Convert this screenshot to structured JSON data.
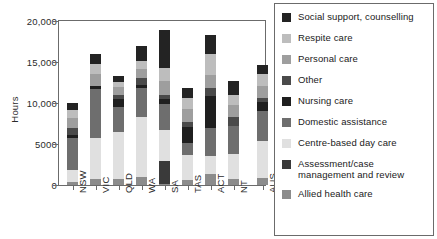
{
  "chart_data": {
    "type": "bar",
    "subtype": "stacked-bar",
    "title": "",
    "xlabel": "",
    "ylabel": "Hours",
    "ylim": [
      0,
      20000
    ],
    "yticks": [
      0,
      5000,
      10000,
      15000,
      20000
    ],
    "ytick_labels": [
      "0",
      "5000",
      "10,000",
      "15,000",
      "20,000"
    ],
    "grid": false,
    "legend_position": "right",
    "categories": [
      "NSW",
      "VIC",
      "QLD",
      "WA",
      "SA",
      "TAS",
      "ACT",
      "NT",
      "AUS"
    ],
    "series": [
      {
        "name": "Allied health care",
        "color": "#8c8c8c",
        "values": [
          420,
          740,
          700,
          950,
          180,
          640,
          1300,
          700,
          900
        ]
      },
      {
        "name": "Assessment/case management and review",
        "color": "#3a3a3a",
        "values": [
          0,
          0,
          0,
          0,
          2700,
          0,
          0,
          0,
          0
        ]
      },
      {
        "name": "Centre-based day care",
        "color": "#e0e0e0",
        "values": [
          1380,
          5050,
          5770,
          7320,
          3800,
          3060,
          2200,
          3050,
          4500
        ]
      },
      {
        "name": "Domestic assistance",
        "color": "#6e6e6e",
        "values": [
          3900,
          5900,
          3100,
          3550,
          3200,
          1450,
          3500,
          3450,
          3600
        ]
      },
      {
        "name": "Nursing care",
        "color": "#1f1f1f",
        "values": [
          450,
          380,
          870,
          440,
          600,
          1900,
          3900,
          0,
          1150
        ]
      },
      {
        "name": "Other",
        "color": "#4a4a4a",
        "values": [
          850,
          0,
          600,
          800,
          450,
          700,
          950,
          1150,
          500
        ]
      },
      {
        "name": "Personal care",
        "color": "#9e9e9e",
        "values": [
          1200,
          1450,
          900,
          1100,
          1700,
          1500,
          1550,
          1450,
          1400
        ]
      },
      {
        "name": "Respite care",
        "color": "#bdbdbd",
        "values": [
          1000,
          1300,
          600,
          1000,
          1700,
          1400,
          2550,
          1200,
          1550
        ]
      },
      {
        "name": "Social support, counselling",
        "color": "#232323",
        "values": [
          750,
          1180,
          760,
          1840,
          4550,
          1150,
          2300,
          1650,
          1100
        ]
      }
    ],
    "totals": [
      9950,
      16000,
      13300,
      17000,
      18880,
      11800,
      18250,
      12650,
      14700
    ]
  },
  "axis": {
    "y_label": "Hours",
    "y_tick_labels": [
      "20,000",
      "15,000",
      "10,000",
      "5000",
      "0"
    ],
    "x_tick_labels": [
      "NSW",
      "VIC",
      "QLD",
      "WA",
      "SA",
      "TAS",
      "ACT",
      "NT",
      "AUS"
    ]
  },
  "legend": {
    "items": [
      {
        "label": "Social support, counselling",
        "color": "#232323"
      },
      {
        "label": "Respite care",
        "color": "#bdbdbd"
      },
      {
        "label": "Personal care",
        "color": "#9e9e9e"
      },
      {
        "label": "Other",
        "color": "#4a4a4a"
      },
      {
        "label": "Nursing care",
        "color": "#1f1f1f"
      },
      {
        "label": "Domestic assistance",
        "color": "#6e6e6e"
      },
      {
        "label": "Centre-based day care",
        "color": "#e0e0e0"
      },
      {
        "label": "Assessment/case management and review",
        "color": "#3a3a3a"
      },
      {
        "label": "Allied health care",
        "color": "#8c8c8c"
      }
    ]
  }
}
